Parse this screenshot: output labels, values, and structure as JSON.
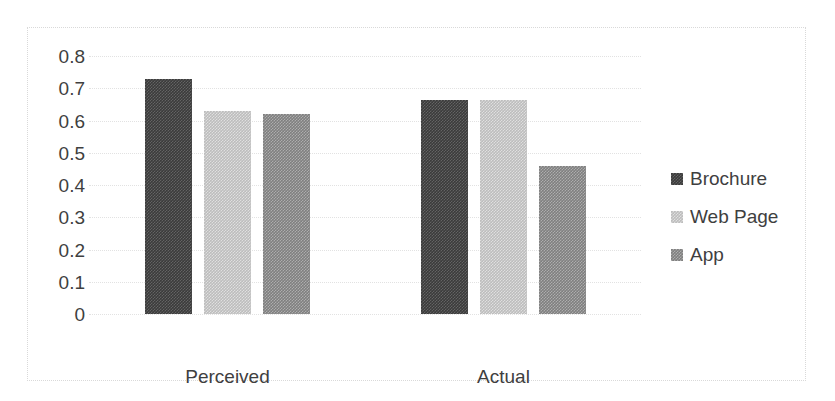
{
  "chart_data": {
    "type": "bar",
    "title": "",
    "subtitle": "",
    "xlabel": "",
    "ylabel": "",
    "categories": [
      "Perceived",
      "Actual"
    ],
    "series": [
      {
        "name": "Brochure",
        "color": "#3b3b3b",
        "values": [
          0.73,
          0.665
        ]
      },
      {
        "name": "Web Page",
        "color": "#bdbdbd",
        "values": [
          0.63,
          0.665
        ]
      },
      {
        "name": "App",
        "color": "#7f7f7f",
        "values": [
          0.62,
          0.46
        ]
      }
    ],
    "ylim": [
      0,
      0.8
    ],
    "ytick_labels": [
      "0.8",
      "0.7",
      "0.6",
      "0.5",
      "0.4",
      "0.3",
      "0.2",
      "0.1",
      "0"
    ],
    "ytick_values": [
      0.8,
      0.7,
      0.6,
      0.5,
      0.4,
      0.3,
      0.2,
      0.1,
      0
    ],
    "grid": true,
    "grid_axis": "y",
    "legend_position": "right",
    "legend_entries": [
      "Brochure",
      "Web Page",
      "App"
    ],
    "annotations": []
  },
  "frame": {
    "border_color": "#d9d9d9",
    "background": "#ffffff"
  }
}
